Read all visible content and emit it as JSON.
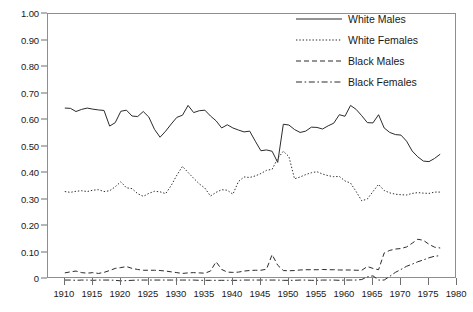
{
  "chart_data": {
    "type": "line",
    "title": "",
    "xlabel": "",
    "ylabel": "",
    "xlim": [
      1907,
      1980
    ],
    "ylim": [
      0,
      1.0
    ],
    "grid": false,
    "legend_position": "top-right",
    "y_ticks": [
      "1.00",
      "0.90",
      "0.80",
      "0.70",
      "0.60",
      "0.50",
      "0.40",
      "0.30",
      "0.20",
      "0.10",
      "0"
    ],
    "y_tick_values": [
      1.0,
      0.9,
      0.8,
      0.7,
      0.6,
      0.5,
      0.4,
      0.3,
      0.2,
      0.1,
      0.0
    ],
    "x_ticks": [
      "1910",
      "1915",
      "1920",
      "1925",
      "1930",
      "1935",
      "1940",
      "1945",
      "1950",
      "1955",
      "1960",
      "1965",
      "1970",
      "1975",
      "1980"
    ],
    "x_tick_values": [
      1910,
      1915,
      1920,
      1925,
      1930,
      1935,
      1940,
      1945,
      1950,
      1955,
      1960,
      1965,
      1970,
      1975,
      1980
    ],
    "x": [
      1910,
      1911,
      1912,
      1913,
      1914,
      1915,
      1916,
      1917,
      1918,
      1919,
      1920,
      1921,
      1922,
      1923,
      1924,
      1925,
      1926,
      1927,
      1928,
      1929,
      1930,
      1931,
      1932,
      1933,
      1934,
      1935,
      1936,
      1937,
      1938,
      1939,
      1940,
      1941,
      1942,
      1943,
      1944,
      1945,
      1946,
      1947,
      1948,
      1949,
      1950,
      1951,
      1952,
      1953,
      1954,
      1955,
      1956,
      1957,
      1958,
      1959,
      1960,
      1961,
      1962,
      1963,
      1964,
      1965,
      1966,
      1967,
      1968,
      1969,
      1970,
      1971,
      1972,
      1973,
      1974,
      1975,
      1976,
      1977
    ],
    "series": [
      {
        "name": "White Males",
        "style": "solid",
        "color": "#2b2b2b",
        "values": [
          0.645,
          0.644,
          0.632,
          0.64,
          0.645,
          0.641,
          0.638,
          0.636,
          0.577,
          0.59,
          0.633,
          0.637,
          0.615,
          0.613,
          0.632,
          0.611,
          0.565,
          0.535,
          0.558,
          0.585,
          0.61,
          0.618,
          0.655,
          0.628,
          0.635,
          0.637,
          0.615,
          0.597,
          0.57,
          0.582,
          0.57,
          0.562,
          0.555,
          0.558,
          0.52,
          0.484,
          0.487,
          0.482,
          0.44,
          0.584,
          0.581,
          0.564,
          0.553,
          0.558,
          0.573,
          0.572,
          0.566,
          0.578,
          0.588,
          0.62,
          0.614,
          0.655,
          0.64,
          0.616,
          0.59,
          0.589,
          0.62,
          0.57,
          0.553,
          0.545,
          0.543,
          0.52,
          0.483,
          0.461,
          0.445,
          0.443,
          0.455,
          0.471
        ]
      },
      {
        "name": "White Females",
        "style": "dotted",
        "color": "#2b2b2b",
        "values": [
          0.33,
          0.327,
          0.331,
          0.333,
          0.33,
          0.335,
          0.337,
          0.33,
          0.333,
          0.348,
          0.367,
          0.344,
          0.341,
          0.322,
          0.312,
          0.323,
          0.331,
          0.329,
          0.322,
          0.353,
          0.392,
          0.425,
          0.402,
          0.38,
          0.359,
          0.343,
          0.313,
          0.327,
          0.337,
          0.335,
          0.32,
          0.368,
          0.385,
          0.383,
          0.389,
          0.398,
          0.41,
          0.414,
          0.455,
          0.482,
          0.462,
          0.378,
          0.385,
          0.394,
          0.401,
          0.405,
          0.396,
          0.39,
          0.386,
          0.387,
          0.37,
          0.362,
          0.33,
          0.295,
          0.302,
          0.33,
          0.357,
          0.334,
          0.325,
          0.32,
          0.318,
          0.317,
          0.323,
          0.326,
          0.324,
          0.323,
          0.328,
          0.328
        ]
      },
      {
        "name": "Black Males",
        "style": "dashed",
        "color": "#2b2b2b",
        "values": [
          0.023,
          0.027,
          0.03,
          0.024,
          0.022,
          0.024,
          0.021,
          0.025,
          0.032,
          0.04,
          0.043,
          0.047,
          0.04,
          0.036,
          0.033,
          0.033,
          0.033,
          0.032,
          0.03,
          0.027,
          0.024,
          0.021,
          0.023,
          0.024,
          0.023,
          0.022,
          0.03,
          0.065,
          0.036,
          0.026,
          0.025,
          0.026,
          0.03,
          0.032,
          0.033,
          0.033,
          0.037,
          0.092,
          0.052,
          0.032,
          0.031,
          0.032,
          0.034,
          0.035,
          0.035,
          0.035,
          0.036,
          0.035,
          0.035,
          0.034,
          0.034,
          0.034,
          0.033,
          0.033,
          0.047,
          0.04,
          0.035,
          0.098,
          0.108,
          0.113,
          0.115,
          0.121,
          0.135,
          0.15,
          0.146,
          0.131,
          0.12,
          0.117
        ]
      },
      {
        "name": "Black Females",
        "style": "dashdot",
        "color": "#2b2b2b",
        "values": [
          -0.004,
          -0.004,
          -0.005,
          -0.004,
          -0.004,
          -0.005,
          -0.004,
          -0.004,
          -0.004,
          -0.005,
          -0.007,
          -0.006,
          -0.005,
          -0.004,
          -0.004,
          -0.004,
          -0.004,
          -0.004,
          -0.004,
          -0.004,
          -0.004,
          -0.004,
          -0.004,
          -0.004,
          -0.005,
          -0.005,
          -0.005,
          -0.005,
          -0.005,
          -0.005,
          -0.005,
          -0.005,
          -0.004,
          -0.004,
          -0.004,
          -0.004,
          -0.004,
          -0.004,
          -0.004,
          -0.005,
          -0.005,
          -0.005,
          -0.004,
          -0.004,
          -0.005,
          -0.005,
          -0.004,
          -0.004,
          -0.004,
          -0.005,
          -0.004,
          -0.004,
          -0.004,
          -0.002,
          0.008,
          0.012,
          -0.004,
          -0.004,
          0.01,
          0.025,
          0.036,
          0.048,
          0.056,
          0.065,
          0.072,
          0.08,
          0.086,
          0.088
        ]
      }
    ]
  },
  "legend": {
    "items": [
      {
        "label": "White Males",
        "style": "solid"
      },
      {
        "label": "White Females",
        "style": "dotted"
      },
      {
        "label": "Black Males",
        "style": "dashed"
      },
      {
        "label": "Black Females",
        "style": "dashdot"
      }
    ]
  },
  "caption": {
    "text": ""
  }
}
